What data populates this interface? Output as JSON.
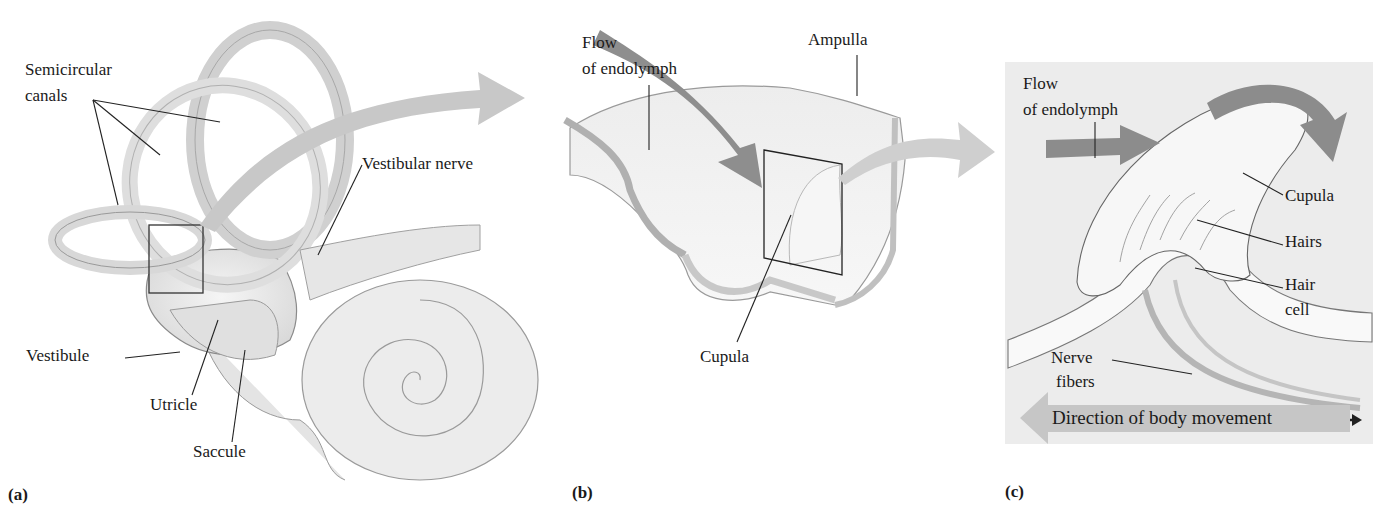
{
  "figure": {
    "panels": [
      {
        "id": "(a)",
        "labels": {
          "semicircular": "Semicircular",
          "canals": "canals",
          "vestibular_nerve": "Vestibular nerve",
          "vestibule": "Vestibule",
          "utricle": "Utricle",
          "saccule": "Saccule"
        }
      },
      {
        "id": "(b)",
        "labels": {
          "flow_line1": "Flow",
          "flow_line2": "of endolymph",
          "ampulla": "Ampulla",
          "cupula": "Cupula"
        }
      },
      {
        "id": "(c)",
        "labels": {
          "flow_line1": "Flow",
          "flow_line2": "of endolymph",
          "cupula": "Cupula",
          "hairs": "Hairs",
          "hair_line1": "Hair",
          "hair_line2": "cell",
          "nerve_line1": "Nerve",
          "nerve_line2": "fibers",
          "direction": "Direction of body movement"
        }
      }
    ],
    "colors": {
      "arrow_dark": "#8c8c8c",
      "arrow_light": "#c4c4c4",
      "tissue": "#e8e8e8",
      "panel_bg": "#ececec",
      "outline": "#6e6e6e"
    }
  }
}
